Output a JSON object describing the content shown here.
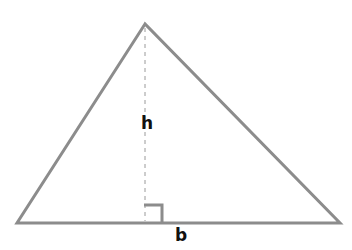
{
  "diagram": {
    "labels": {
      "height": "h",
      "base": "b"
    },
    "colors": {
      "outline": "#8c8c8c",
      "height_line": "#9a9a9a",
      "right_angle_marker": "#8c8c8c",
      "label": "#111111",
      "background": "#ffffff"
    }
  }
}
